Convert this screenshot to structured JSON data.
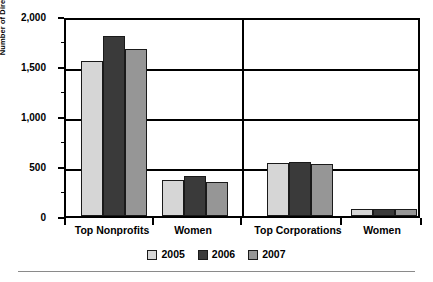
{
  "chart_data": {
    "type": "bar",
    "title": "",
    "xlabel": "",
    "ylabel": "Number of Directors",
    "ylim": [
      0,
      2000
    ],
    "ytick_labels": [
      "0",
      "500",
      "1,000",
      "1,500",
      "2,000"
    ],
    "ytick_values": [
      0,
      500,
      1000,
      1500,
      2000
    ],
    "grid": true,
    "legend_position": "bottom",
    "categories": [
      "Top Nonprofits",
      "Women",
      "Top Corporations",
      "Women"
    ],
    "series": [
      {
        "name": "2005",
        "color": "#d6d6d6",
        "values": [
          1550,
          365,
          530,
          75
        ]
      },
      {
        "name": "2006",
        "color": "#3a3a3a",
        "values": [
          1805,
          405,
          540,
          72
        ]
      },
      {
        "name": "2007",
        "color": "#969696",
        "values": [
          1675,
          340,
          520,
          72
        ]
      }
    ]
  },
  "legend": {
    "items": [
      {
        "label": "2005",
        "color": "#d6d6d6"
      },
      {
        "label": "2006",
        "color": "#3a3a3a"
      },
      {
        "label": "2007",
        "color": "#969696"
      }
    ]
  }
}
